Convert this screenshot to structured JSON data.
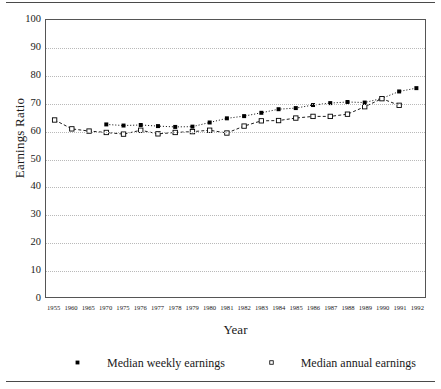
{
  "chart_data": {
    "type": "line",
    "title": "",
    "xlabel": "Year",
    "ylabel": "Earnings Ratio",
    "ylim": [
      0,
      100
    ],
    "ytick_labels": [
      "100",
      "90",
      "80",
      "70",
      "60",
      "50",
      "40",
      "30",
      "20",
      "10",
      "0"
    ],
    "ytick_values": [
      100,
      90,
      80,
      70,
      60,
      50,
      40,
      30,
      20,
      10,
      0
    ],
    "grid": true,
    "grid_style": "dotted-horizontal",
    "legend_position": "below-axis",
    "categories": [
      "1955",
      "1960",
      "1965",
      "1970",
      "1975",
      "1976",
      "1977",
      "1978",
      "1979",
      "1980",
      "1981",
      "1982",
      "1983",
      "1984",
      "1985",
      "1986",
      "1987",
      "1988",
      "1989",
      "1990",
      "1991",
      "1992"
    ],
    "series": [
      {
        "name": "Median weekly earnings",
        "marker": "filled-square",
        "line_style": "dotted",
        "color": "#000000",
        "values": [
          null,
          null,
          null,
          62.3,
          61.9,
          62.1,
          61.7,
          61.4,
          61.5,
          63.0,
          64.5,
          65.3,
          66.5,
          67.8,
          68.2,
          69.3,
          70.0,
          70.4,
          70.2,
          71.7,
          74.2,
          75.4
        ]
      },
      {
        "name": "Median annual earnings",
        "marker": "open-square",
        "line_style": "dashed",
        "color": "#000000",
        "values": [
          63.9,
          60.7,
          59.9,
          59.4,
          58.8,
          60.2,
          58.9,
          59.4,
          59.7,
          60.2,
          59.2,
          61.7,
          63.6,
          63.7,
          64.6,
          65.2,
          65.2,
          66.0,
          68.7,
          71.6,
          69.2,
          null
        ]
      }
    ]
  },
  "legend": {
    "entries": [
      {
        "label": "Median weekly earnings"
      },
      {
        "label": "Median annual earnings"
      }
    ]
  },
  "axes": {
    "y_title": "Earnings Ratio",
    "x_title": "Year"
  }
}
